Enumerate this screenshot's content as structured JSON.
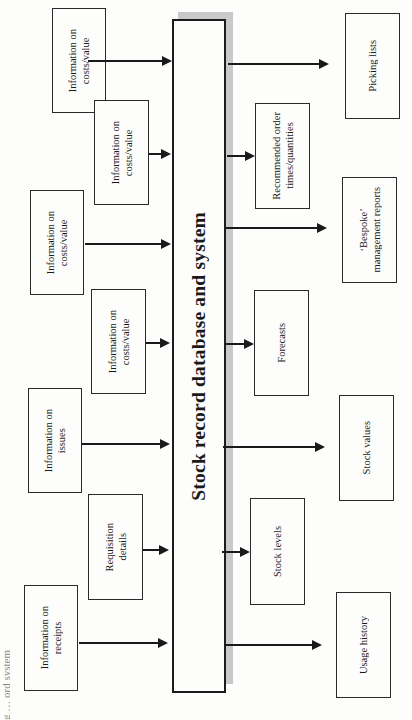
{
  "caption_fragment": "g … ord system",
  "central": {
    "label": "Stock record database and system"
  },
  "inputs": [
    {
      "label": "Information on\ncosts/value"
    },
    {
      "label": "Information on\ncosts/value"
    },
    {
      "label": "Information on\ncosts/value"
    },
    {
      "label": "Information on\ncosts/value"
    },
    {
      "label": "Information on\nissues"
    },
    {
      "label": "Requisition\ndetails"
    },
    {
      "label": "Information on\nreceipts"
    }
  ],
  "outputs": [
    {
      "label": "Picking lists"
    },
    {
      "label": "Recommended order\ntimes/quantities"
    },
    {
      "label": "‘Bespoke’\nmanagement reports"
    },
    {
      "label": "Forecasts"
    },
    {
      "label": "Stock values"
    },
    {
      "label": "Stock levels"
    },
    {
      "label": "Usage history"
    }
  ],
  "colors": {
    "line": "#1a1a1a",
    "shadow": "#c9c9c9",
    "background": "#fdfdfb"
  }
}
